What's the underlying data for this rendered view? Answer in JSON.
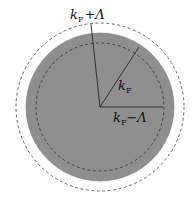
{
  "diagram": {
    "colors": {
      "background": "#ffffff",
      "fermi_disk_fill": "#8f8f8f",
      "line": "#222222",
      "dashed": "#555555"
    },
    "geometry": {
      "center": [
        100,
        107
      ],
      "r_outer": 84,
      "r_fermi": 74,
      "r_inner": 64
    },
    "labels": {
      "outer_radius": {
        "base": "k",
        "sub": "F",
        "op": "+",
        "sym": "Λ"
      },
      "fermi_radius": {
        "base": "k",
        "sub": "F"
      },
      "inner_radius": {
        "base": "k",
        "sub": "F",
        "op": "−",
        "sym": "Λ"
      }
    }
  }
}
